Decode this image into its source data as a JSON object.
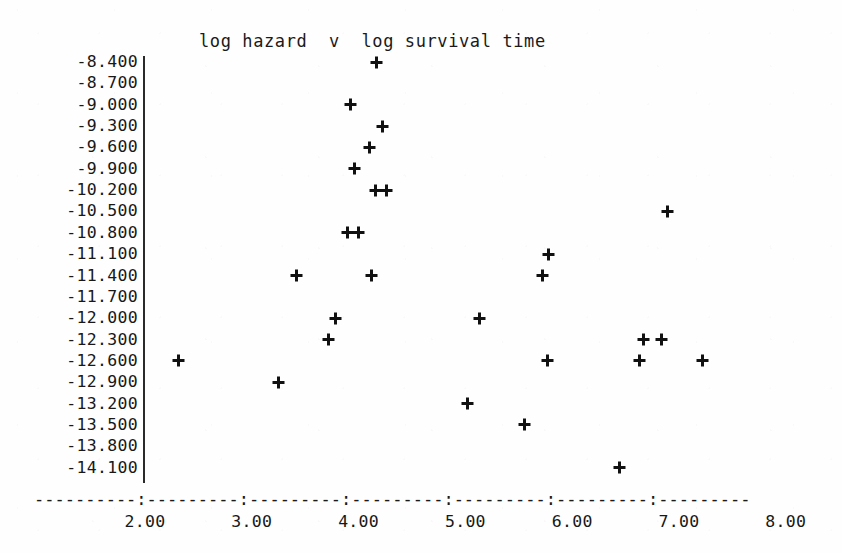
{
  "chart_data": {
    "type": "scatter",
    "title": "log hazard  v  log survival time",
    "xlabel": "",
    "ylabel": "",
    "marker": "plus",
    "grid": false,
    "legend": null,
    "xlim": [
      1.55,
      8.3
    ],
    "ylim": [
      -14.4,
      -8.25
    ],
    "x_ticks": [
      2.0,
      3.0,
      4.0,
      5.0,
      6.0,
      7.0,
      8.0
    ],
    "x_tick_labels": [
      "2.00",
      "3.00",
      "4.00",
      "5.00",
      "6.00",
      "7.00",
      "8.00"
    ],
    "y_ticks": [
      -8.4,
      -8.7,
      -9.0,
      -9.3,
      -9.6,
      -9.9,
      -10.2,
      -10.5,
      -10.8,
      -11.1,
      -11.4,
      -11.7,
      -12.0,
      -12.3,
      -12.6,
      -12.9,
      -13.2,
      -13.5,
      -13.8,
      -14.1
    ],
    "y_tick_labels": [
      "-8.400",
      "-8.700",
      "-9.000",
      "-9.300",
      "-9.600",
      "-9.900",
      "-10.200",
      "-10.500",
      "-10.800",
      "-11.100",
      "-11.400",
      "-11.700",
      "-12.000",
      "-12.300",
      "-12.600",
      "-12.900",
      "-13.200",
      "-13.500",
      "-13.800",
      "-14.100"
    ],
    "axis_style": {
      "x_axis_rule": "----------:---------:---------:---------:---------:---------:---------",
      "y_axis_rule": "vertical-line"
    },
    "points": [
      {
        "x": 4.17,
        "y": -8.4
      },
      {
        "x": 3.92,
        "y": -9.0
      },
      {
        "x": 4.22,
        "y": -9.3
      },
      {
        "x": 4.1,
        "y": -9.6
      },
      {
        "x": 3.96,
        "y": -9.9
      },
      {
        "x": 4.16,
        "y": -10.2
      },
      {
        "x": 4.26,
        "y": -10.2
      },
      {
        "x": 6.89,
        "y": -10.5
      },
      {
        "x": 3.9,
        "y": -10.8
      },
      {
        "x": 4.0,
        "y": -10.8
      },
      {
        "x": 5.78,
        "y": -11.1
      },
      {
        "x": 3.42,
        "y": -11.4
      },
      {
        "x": 4.12,
        "y": -11.4
      },
      {
        "x": 5.72,
        "y": -11.4
      },
      {
        "x": 3.78,
        "y": -12.0
      },
      {
        "x": 5.13,
        "y": -12.0
      },
      {
        "x": 3.72,
        "y": -12.3
      },
      {
        "x": 6.67,
        "y": -12.3
      },
      {
        "x": 6.84,
        "y": -12.3
      },
      {
        "x": 2.31,
        "y": -12.6
      },
      {
        "x": 5.77,
        "y": -12.6
      },
      {
        "x": 6.63,
        "y": -12.6
      },
      {
        "x": 7.22,
        "y": -12.6
      },
      {
        "x": 3.25,
        "y": -12.9
      },
      {
        "x": 5.02,
        "y": -13.2
      },
      {
        "x": 5.55,
        "y": -13.5
      },
      {
        "x": 6.44,
        "y": -14.1
      }
    ]
  }
}
